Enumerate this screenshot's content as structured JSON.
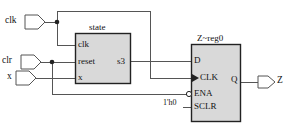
{
  "diagram": {
    "type": "rtl-schematic",
    "colors": {
      "wire": "#555555",
      "block_fill": "#d9d9d9",
      "block_stroke": "#222222",
      "text": "#111111",
      "background": "#ffffff"
    },
    "input_ports": [
      {
        "name": "clk",
        "label": "clk"
      },
      {
        "name": "clr",
        "label": "clr"
      },
      {
        "name": "x",
        "label": "x"
      }
    ],
    "output_ports": [
      {
        "name": "Z",
        "label": "Z"
      }
    ],
    "blocks": [
      {
        "name": "state",
        "title": "state",
        "inputs": [
          "clk",
          "reset",
          "x"
        ],
        "outputs": [
          "s3"
        ]
      },
      {
        "name": "Z~reg0",
        "title": "Z~reg0",
        "inputs": [
          "D",
          "CLK",
          "ENA",
          "SCLR"
        ],
        "outputs": [
          "Q"
        ]
      }
    ],
    "block_pins": {
      "state": {
        "clk": "clk",
        "reset": "reset",
        "x": "x",
        "s3": "s3"
      },
      "zreg0": {
        "d": "D",
        "clk": "CLK",
        "ena": "ENA",
        "sclr": "SCLR",
        "q": "Q"
      }
    },
    "constants": [
      {
        "name": "sclr-constant",
        "label": "1'h0"
      }
    ],
    "nets": [
      {
        "from": "clk",
        "to": [
          "state.clk",
          "Z~reg0.CLK"
        ]
      },
      {
        "from": "clr",
        "to": [
          "state.reset",
          "Z~reg0.ENA"
        ]
      },
      {
        "from": "x",
        "to": [
          "state.x"
        ]
      },
      {
        "from": "state.s3",
        "to": [
          "Z~reg0.D"
        ]
      },
      {
        "from": "1'h0",
        "to": [
          "Z~reg0.SCLR"
        ]
      },
      {
        "from": "Z~reg0.Q",
        "to": [
          "Z"
        ]
      }
    ]
  }
}
